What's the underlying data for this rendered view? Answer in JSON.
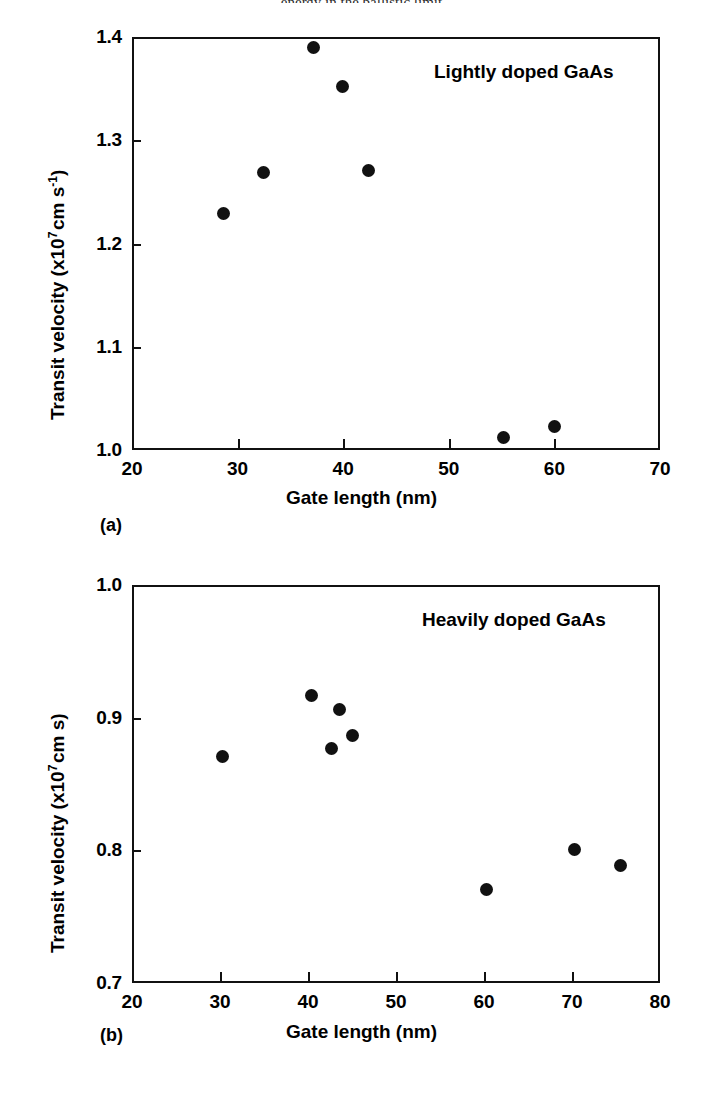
{
  "figure": {
    "background": "#ffffff",
    "ink_color": "#111111",
    "header_fragment": "energy in the ballistic limit"
  },
  "chart_data": [
    {
      "id": "panel-a",
      "type": "scatter",
      "title": "",
      "annotation": "Lightly doped GaAs",
      "caption": "(a)",
      "xlabel": "Gate length (nm)",
      "ylabel": "Transit velocity (x10⁷ cm s⁻¹)",
      "ylabel_parts": {
        "pre": "Transit velocity (x10",
        "exp": "7",
        "mid": " cm s",
        "exp2": "-1",
        "post": ")"
      },
      "xlim": [
        20,
        70
      ],
      "ylim": [
        1.0,
        1.4
      ],
      "xticks": [
        20,
        30,
        40,
        50,
        60,
        70
      ],
      "yticks": [
        1.0,
        1.1,
        1.2,
        1.3,
        1.4
      ],
      "xticklabels": [
        "20",
        "30",
        "40",
        "50",
        "60",
        "70"
      ],
      "yticklabels": [
        "1.0",
        "1.1",
        "1.2",
        "1.3",
        "1.4"
      ],
      "grid": false,
      "legend": "none",
      "marker": "filled-circle",
      "points": [
        {
          "x": 28.5,
          "y": 1.231
        },
        {
          "x": 32.3,
          "y": 1.271
        },
        {
          "x": 37.0,
          "y": 1.392
        },
        {
          "x": 39.7,
          "y": 1.354
        },
        {
          "x": 42.2,
          "y": 1.273
        },
        {
          "x": 55.0,
          "y": 1.014
        },
        {
          "x": 59.8,
          "y": 1.025
        }
      ]
    },
    {
      "id": "panel-b",
      "type": "scatter",
      "title": "",
      "annotation": "Heavily doped GaAs",
      "caption": "(b)",
      "xlabel": "Gate length (nm)",
      "ylabel": "Transit velocity (x10⁷ cm s)",
      "ylabel_parts": {
        "pre": "Transit velocity (x10",
        "exp": "7",
        "mid": " cm s",
        "exp2": "",
        "post": ")"
      },
      "xlim": [
        20,
        80
      ],
      "ylim": [
        0.7,
        1.0
      ],
      "xticks": [
        20,
        30,
        40,
        50,
        60,
        70,
        80
      ],
      "yticks": [
        0.7,
        0.8,
        0.9,
        1.0
      ],
      "xticklabels": [
        "20",
        "30",
        "40",
        "50",
        "60",
        "70",
        "80"
      ],
      "yticklabels": [
        "0.7",
        "0.8",
        "0.9",
        "1.0"
      ],
      "grid": false,
      "legend": "none",
      "marker": "filled-circle",
      "points": [
        {
          "x": 30.0,
          "y": 0.872
        },
        {
          "x": 40.2,
          "y": 0.918
        },
        {
          "x": 43.3,
          "y": 0.908
        },
        {
          "x": 42.4,
          "y": 0.878
        },
        {
          "x": 44.8,
          "y": 0.888
        },
        {
          "x": 60.0,
          "y": 0.772
        },
        {
          "x": 70.0,
          "y": 0.802
        },
        {
          "x": 75.3,
          "y": 0.79
        }
      ]
    }
  ]
}
